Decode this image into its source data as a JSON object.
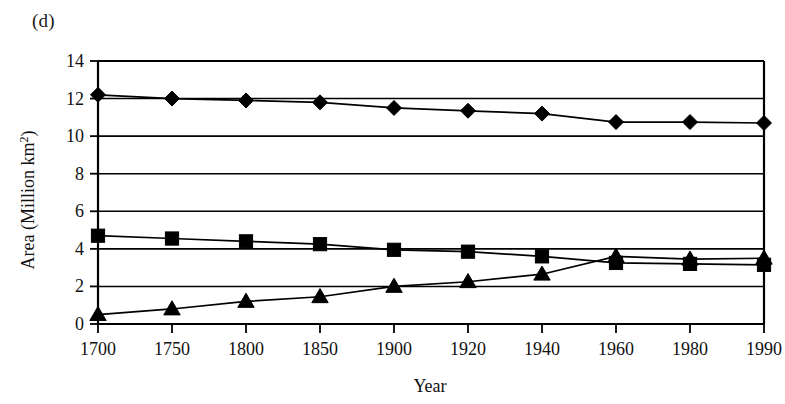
{
  "panel_label": "(d)",
  "chart_data": {
    "type": "line",
    "title": "",
    "xlabel": "Year",
    "ylabel": "Area (Million km2)",
    "ylabel_base": "Area (Million km",
    "ylabel_sup": "2",
    "ylabel_tail": ")",
    "categories": [
      "1700",
      "1750",
      "1800",
      "1850",
      "1900",
      "1920",
      "1940",
      "1960",
      "1980",
      "1990"
    ],
    "yticks": [
      0,
      2,
      4,
      6,
      8,
      10,
      12,
      14
    ],
    "ylim": [
      0,
      14
    ],
    "grid": true,
    "legend": "none",
    "series": [
      {
        "name": "Forest/woodland",
        "marker": "diamond",
        "color": "#000000",
        "values": [
          12.2,
          12.0,
          11.9,
          11.8,
          11.5,
          11.35,
          11.2,
          10.75,
          10.75,
          10.7
        ]
      },
      {
        "name": "Grassland/pasture",
        "marker": "square",
        "color": "#000000",
        "values": [
          4.7,
          4.55,
          4.4,
          4.25,
          3.95,
          3.85,
          3.6,
          3.25,
          3.2,
          3.15
        ]
      },
      {
        "name": "Cropland",
        "marker": "triangle",
        "color": "#000000",
        "values": [
          0.5,
          0.8,
          1.2,
          1.45,
          2.0,
          2.25,
          2.65,
          3.6,
          3.45,
          3.5
        ]
      }
    ]
  }
}
